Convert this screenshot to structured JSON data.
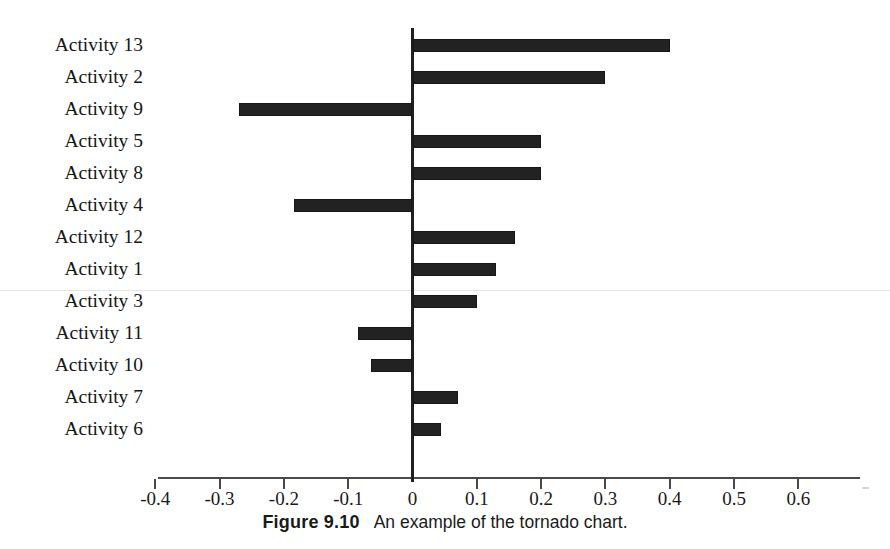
{
  "caption": {
    "figure_number": "Figure 9.10",
    "text": "An example of the tornado chart."
  },
  "axis": {
    "tick_labels": [
      "-0.4",
      "-0.3",
      "-0.2",
      "-0.1",
      "0",
      "0.1",
      "0.2",
      "0.3",
      "0.4",
      "0.5",
      "0.6"
    ],
    "tick_values": [
      -0.4,
      -0.3,
      -0.2,
      -0.1,
      0,
      0.1,
      0.2,
      0.3,
      0.4,
      0.5,
      0.6
    ]
  },
  "colors": {
    "bar": "#222222",
    "axis": "#4a4a4a",
    "zero_axis": "#1f1f1f",
    "text": "#1a1a1a",
    "background": "#ffffff"
  },
  "chart_data": {
    "type": "bar",
    "orientation": "horizontal",
    "title": "",
    "subtitle": "",
    "xlabel": "",
    "ylabel": "",
    "xlim": [
      -0.4,
      0.6
    ],
    "ylim": null,
    "grid": false,
    "legend": null,
    "zero_reference_line": 0,
    "tick_step": 0.1,
    "categories": [
      "Activity 13",
      "Activity 2",
      "Activity 9",
      "Activity 5",
      "Activity 8",
      "Activity 4",
      "Activity 12",
      "Activity 1",
      "Activity 3",
      "Activity 11",
      "Activity 10",
      "Activity 7",
      "Activity 6"
    ],
    "values": [
      0.4,
      0.3,
      -0.27,
      0.2,
      0.2,
      -0.185,
      0.16,
      0.13,
      0.1,
      -0.085,
      -0.065,
      0.07,
      0.045
    ]
  }
}
